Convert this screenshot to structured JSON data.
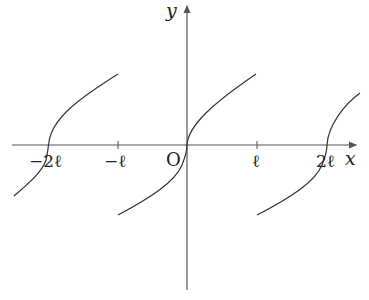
{
  "axes": {
    "x_label": "x",
    "y_label": "y",
    "origin_label": "O"
  },
  "ticks": [
    {
      "label": "−2ℓ",
      "value": "-2l"
    },
    {
      "label": "−ℓ",
      "value": "-l"
    },
    {
      "label": "ℓ",
      "value": "l"
    },
    {
      "label": "2ℓ",
      "value": "2l"
    }
  ],
  "curve": {
    "description": "Periodic cube-root-like curve, period 2ℓ, crossing x-axis at 0 and ±2ℓ with vertical tangent",
    "color": "#333333"
  },
  "colors": {
    "axis": "#555555",
    "curve": "#333333",
    "text": "#222222"
  }
}
